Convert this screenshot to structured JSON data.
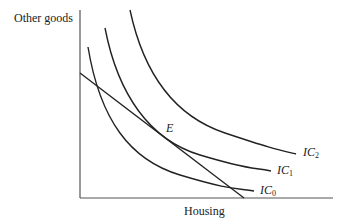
{
  "diagram": {
    "y_axis_label": "Other goods",
    "x_axis_label": "Housing",
    "equilibrium_label": "E",
    "curves": [
      {
        "name": "IC",
        "subscript": "0"
      },
      {
        "name": "IC",
        "subscript": "1"
      },
      {
        "name": "IC",
        "subscript": "2"
      }
    ],
    "line_color": "#222222",
    "axis_color": "#555555"
  }
}
